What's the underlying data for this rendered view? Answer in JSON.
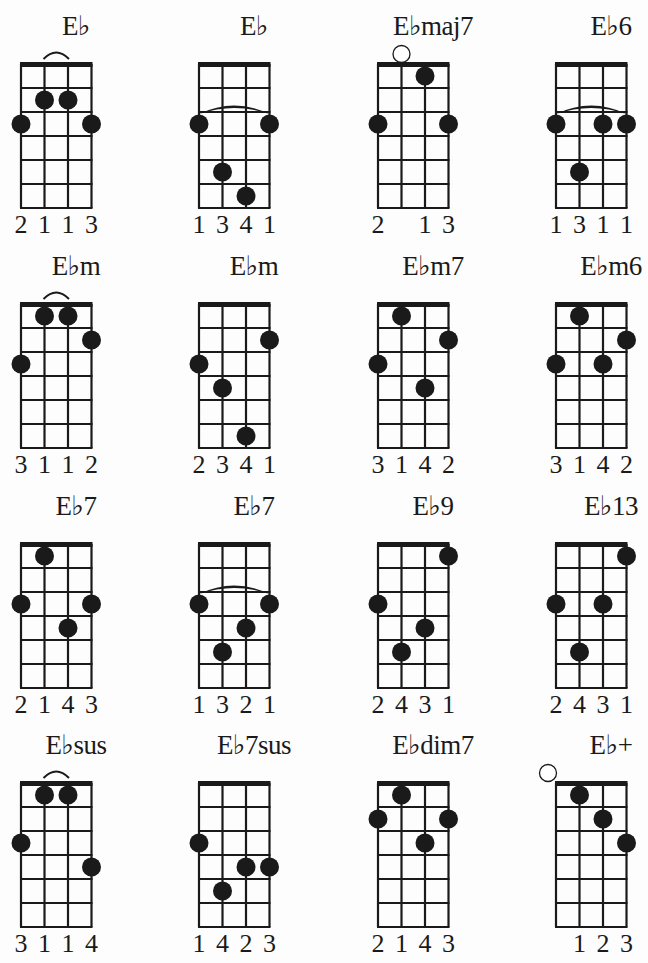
{
  "sheet": {
    "instrument": "ukulele",
    "strings": 4,
    "frets_shown": 6,
    "colors": {
      "ink": "#1a1a1a",
      "paper": "#fdfdfd"
    }
  },
  "chords": [
    {
      "name": "E♭",
      "dots": [
        [
          1,
          2
        ],
        [
          2,
          2
        ],
        [
          0,
          3
        ],
        [
          3,
          3
        ]
      ],
      "open": [],
      "barre": {
        "fret": 2,
        "from": 1,
        "to": 2,
        "type": "small"
      },
      "fingers": [
        "2",
        "1",
        "1",
        "3"
      ]
    },
    {
      "name": "E♭",
      "dots": [
        [
          0,
          3
        ],
        [
          3,
          3
        ],
        [
          1,
          5
        ],
        [
          2,
          6
        ]
      ],
      "open": [],
      "barre": {
        "fret": 3,
        "from": 0,
        "to": 3,
        "type": "wide"
      },
      "fingers": [
        "1",
        "3",
        "4",
        "1"
      ]
    },
    {
      "name": "E♭maj7",
      "dots": [
        [
          2,
          1
        ],
        [
          0,
          3
        ],
        [
          3,
          3
        ]
      ],
      "open": [
        1
      ],
      "barre": null,
      "fingers": [
        "2",
        "",
        "1",
        "3"
      ]
    },
    {
      "name": "E♭6",
      "dots": [
        [
          0,
          3
        ],
        [
          2,
          3
        ],
        [
          3,
          3
        ],
        [
          1,
          5
        ]
      ],
      "open": [],
      "barre": {
        "fret": 3,
        "from": 0,
        "to": 3,
        "type": "wide"
      },
      "fingers": [
        "1",
        "3",
        "1",
        "1"
      ]
    },
    {
      "name": "E♭m",
      "dots": [
        [
          1,
          1
        ],
        [
          2,
          1
        ],
        [
          3,
          2
        ],
        [
          0,
          3
        ]
      ],
      "open": [],
      "barre": {
        "fret": 1,
        "from": 1,
        "to": 2,
        "type": "small"
      },
      "fingers": [
        "3",
        "1",
        "1",
        "2"
      ]
    },
    {
      "name": "E♭m",
      "dots": [
        [
          3,
          2
        ],
        [
          0,
          3
        ],
        [
          1,
          4
        ],
        [
          2,
          6
        ]
      ],
      "open": [],
      "barre": null,
      "fingers": [
        "2",
        "3",
        "4",
        "1"
      ]
    },
    {
      "name": "E♭m7",
      "dots": [
        [
          1,
          1
        ],
        [
          3,
          2
        ],
        [
          0,
          3
        ],
        [
          2,
          4
        ]
      ],
      "open": [],
      "barre": null,
      "fingers": [
        "3",
        "1",
        "4",
        "2"
      ]
    },
    {
      "name": "E♭m6",
      "dots": [
        [
          1,
          1
        ],
        [
          3,
          2
        ],
        [
          0,
          3
        ],
        [
          2,
          3
        ]
      ],
      "open": [],
      "barre": null,
      "fingers": [
        "3",
        "1",
        "4",
        "2"
      ]
    },
    {
      "name": "E♭7",
      "dots": [
        [
          1,
          1
        ],
        [
          0,
          3
        ],
        [
          3,
          3
        ],
        [
          2,
          4
        ]
      ],
      "open": [],
      "barre": null,
      "fingers": [
        "2",
        "1",
        "4",
        "3"
      ]
    },
    {
      "name": "E♭7",
      "dots": [
        [
          0,
          3
        ],
        [
          3,
          3
        ],
        [
          2,
          4
        ],
        [
          1,
          5
        ]
      ],
      "open": [],
      "barre": {
        "fret": 3,
        "from": 0,
        "to": 3,
        "type": "wide"
      },
      "fingers": [
        "1",
        "3",
        "2",
        "1"
      ]
    },
    {
      "name": "E♭9",
      "dots": [
        [
          3,
          1
        ],
        [
          0,
          3
        ],
        [
          2,
          4
        ],
        [
          1,
          5
        ]
      ],
      "open": [],
      "barre": null,
      "fingers": [
        "2",
        "4",
        "3",
        "1"
      ]
    },
    {
      "name": "E♭13",
      "dots": [
        [
          3,
          1
        ],
        [
          0,
          3
        ],
        [
          2,
          3
        ],
        [
          1,
          5
        ]
      ],
      "open": [],
      "barre": null,
      "fingers": [
        "2",
        "4",
        "3",
        "1"
      ]
    },
    {
      "name": "E♭sus",
      "dots": [
        [
          1,
          1
        ],
        [
          2,
          1
        ],
        [
          0,
          3
        ],
        [
          3,
          4
        ]
      ],
      "open": [],
      "barre": {
        "fret": 1,
        "from": 1,
        "to": 2,
        "type": "small"
      },
      "fingers": [
        "3",
        "1",
        "1",
        "4"
      ]
    },
    {
      "name": "E♭7sus",
      "dots": [
        [
          0,
          3
        ],
        [
          2,
          4
        ],
        [
          3,
          4
        ],
        [
          1,
          5
        ]
      ],
      "open": [],
      "barre": null,
      "fingers": [
        "1",
        "4",
        "2",
        "3"
      ]
    },
    {
      "name": "E♭dim7",
      "dots": [
        [
          1,
          1
        ],
        [
          0,
          2
        ],
        [
          3,
          2
        ],
        [
          2,
          3
        ]
      ],
      "open": [],
      "barre": null,
      "fingers": [
        "2",
        "1",
        "4",
        "3"
      ]
    },
    {
      "name": "E♭+",
      "dots": [
        [
          1,
          1
        ],
        [
          2,
          2
        ],
        [
          3,
          3
        ]
      ],
      "open": [
        0
      ],
      "barre": null,
      "fingers": [
        "",
        "1",
        "2",
        "3"
      ]
    }
  ]
}
